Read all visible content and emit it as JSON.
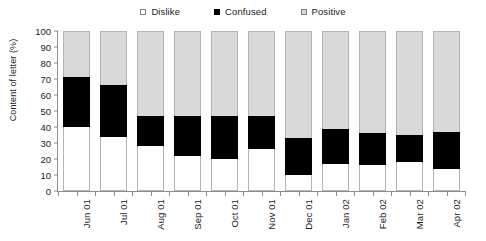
{
  "chart_data": {
    "type": "bar",
    "subtype": "stacked-bar-100",
    "title": "",
    "xlabel": "",
    "ylabel": "Content of letter (%)",
    "ylim": [
      0,
      100
    ],
    "yticks": [
      0,
      10,
      20,
      30,
      40,
      50,
      60,
      70,
      80,
      90,
      100
    ],
    "grid": false,
    "legend_position": "top-center",
    "categories": [
      "Jun 01",
      "Jul 01",
      "Aug 01",
      "Sep 01",
      "Oct 01",
      "Nov 01",
      "Dec 01",
      "Jan 02",
      "Feb 02",
      "Mar 02",
      "Apr 02"
    ],
    "series": [
      {
        "name": "Dislike",
        "color": "#ffffff",
        "values": [
          40,
          34,
          28,
          22,
          20,
          26,
          10,
          17,
          16,
          18,
          14
        ]
      },
      {
        "name": "Confused",
        "color": "#000000",
        "values": [
          31,
          32,
          19,
          25,
          27,
          21,
          23,
          22,
          20,
          17,
          23
        ]
      },
      {
        "name": "Positive",
        "color": "#d9d9d9",
        "values": [
          29,
          34,
          53,
          53,
          53,
          53,
          67,
          61,
          64,
          65,
          63
        ]
      }
    ],
    "cumulative_tops": {
      "dislike": [
        40,
        34,
        28,
        22,
        20,
        26,
        10,
        17,
        16,
        18,
        14
      ],
      "confused": [
        71,
        66,
        47,
        47,
        47,
        47,
        33,
        39,
        36,
        35,
        37
      ],
      "positive": [
        100,
        100,
        100,
        100,
        100,
        100,
        100,
        100,
        100,
        100,
        100
      ]
    }
  },
  "legend": {
    "entries": [
      {
        "label": "Dislike",
        "swatch": "legend-swatch-dislike"
      },
      {
        "label": "Confused",
        "swatch": "legend-swatch-confused"
      },
      {
        "label": "Positive",
        "swatch": "legend-swatch-positive"
      }
    ]
  },
  "colors": {
    "dislike": "#ffffff",
    "confused": "#000000",
    "positive": "#d9d9d9",
    "axis": "#8c8c8c",
    "bar_outline": "#b4b4b4",
    "text": "#1a1a1a",
    "background": "#ffffff"
  }
}
